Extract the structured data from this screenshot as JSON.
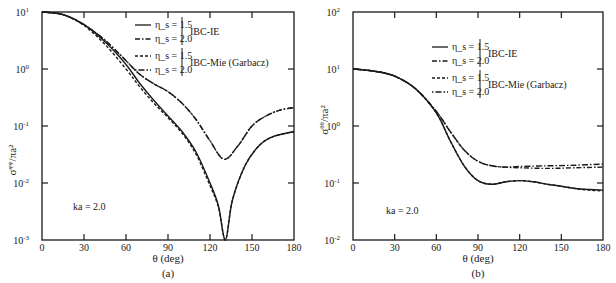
{
  "chart_data": [
    {
      "id": "a",
      "type": "line",
      "panel_label": "(a)",
      "xlabel": "θ (deg)",
      "ylabel": "σ^{φφ}/πa²",
      "ylabel_main": "σ",
      "ylabel_sup": "φφ",
      "ylabel_tail": "/πa²",
      "yscale": "log",
      "xlim": [
        0,
        180
      ],
      "ylim": [
        0.001,
        10
      ],
      "xticks": [
        0,
        30,
        60,
        90,
        120,
        150,
        180
      ],
      "yticks": [
        {
          "value": 10,
          "label_base": "10",
          "label_exp": "1"
        },
        {
          "value": 1,
          "label_base": "10",
          "label_exp": "0"
        },
        {
          "value": 0.1,
          "label_base": "10",
          "label_exp": "-1"
        },
        {
          "value": 0.01,
          "label_base": "10",
          "label_exp": "-2"
        },
        {
          "value": 0.001,
          "label_base": "10",
          "label_exp": "-3"
        }
      ],
      "annotation": "ka = 2.0",
      "grid": false,
      "legend": {
        "position": "upper-right",
        "groups": [
          {
            "label": "IBC-IE",
            "entries": [
              {
                "label": "η_s = 1.5",
                "style": "solid"
              },
              {
                "label": "η_s = 2.0",
                "style": "dash-dot"
              }
            ]
          },
          {
            "label": "IBC-Mie (Garbacz)",
            "entries": [
              {
                "label": "η_s = 1.5",
                "style": "dashed"
              },
              {
                "label": "η_s = 2.0",
                "style": "dot-dash-long"
              }
            ]
          }
        ]
      },
      "series": [
        {
          "name": "IBC-IE η_s = 1.5",
          "style": "solid",
          "x": [
            0,
            15,
            30,
            45,
            60,
            70,
            80,
            90,
            100,
            110,
            120,
            126,
            131,
            136,
            145,
            155,
            165,
            180
          ],
          "y": [
            10,
            9,
            6,
            3,
            1.2,
            0.55,
            0.28,
            0.15,
            0.08,
            0.035,
            0.01,
            0.004,
            0.001,
            0.005,
            0.02,
            0.045,
            0.065,
            0.08
          ]
        },
        {
          "name": "IBC-Mie η_s = 1.5",
          "style": "dashed",
          "x": [
            0,
            15,
            30,
            45,
            60,
            70,
            80,
            90,
            100,
            110,
            120,
            126,
            131,
            136,
            145,
            155,
            165,
            180
          ],
          "y": [
            10,
            9,
            5.8,
            2.7,
            1.0,
            0.48,
            0.25,
            0.14,
            0.075,
            0.032,
            0.009,
            0.0038,
            0.001,
            0.005,
            0.02,
            0.045,
            0.065,
            0.08
          ]
        },
        {
          "name": "IBC-IE η_s = 2.0",
          "style": "dash-dot",
          "x": [
            0,
            15,
            30,
            45,
            60,
            70,
            80,
            90,
            100,
            110,
            120,
            130,
            140,
            150,
            160,
            170,
            180
          ],
          "y": [
            10,
            9,
            6,
            3.2,
            1.4,
            0.8,
            0.55,
            0.4,
            0.25,
            0.13,
            0.055,
            0.026,
            0.045,
            0.1,
            0.15,
            0.19,
            0.21
          ]
        },
        {
          "name": "IBC-Mie η_s = 2.0",
          "style": "dot-dash-long",
          "x": [
            0,
            15,
            30,
            45,
            60,
            70,
            80,
            90,
            100,
            110,
            120,
            130,
            140,
            150,
            160,
            170,
            180
          ],
          "y": [
            10,
            9,
            6,
            3.2,
            1.4,
            0.8,
            0.55,
            0.4,
            0.25,
            0.13,
            0.055,
            0.026,
            0.045,
            0.1,
            0.15,
            0.19,
            0.21
          ]
        }
      ]
    },
    {
      "id": "b",
      "type": "line",
      "panel_label": "(b)",
      "xlabel": "θ (deg)",
      "ylabel": "σ^{θθ}/πa²",
      "ylabel_main": "σ",
      "ylabel_sup": "θθ",
      "ylabel_tail": "/πa²",
      "yscale": "log",
      "xlim": [
        0,
        180
      ],
      "ylim": [
        0.01,
        100
      ],
      "xticks": [
        0,
        30,
        60,
        90,
        120,
        150,
        180
      ],
      "yticks": [
        {
          "value": 100,
          "label_base": "10",
          "label_exp": "2"
        },
        {
          "value": 10,
          "label_base": "10",
          "label_exp": "1"
        },
        {
          "value": 1,
          "label_base": "10",
          "label_exp": "0"
        },
        {
          "value": 0.1,
          "label_base": "10",
          "label_exp": "-1"
        },
        {
          "value": 0.01,
          "label_base": "10",
          "label_exp": "-2"
        }
      ],
      "annotation": "ka = 2.0",
      "grid": false,
      "legend": {
        "position": "upper-right",
        "groups": [
          {
            "label": "IBC-IE",
            "entries": [
              {
                "label": "η_s = 1.5",
                "style": "solid"
              },
              {
                "label": "η_s = 2.0",
                "style": "dash-dot"
              }
            ]
          },
          {
            "label": "IBC-Mie (Garbacz)",
            "entries": [
              {
                "label": "η_s = 1.5",
                "style": "dashed"
              },
              {
                "label": "η_s = 2.0",
                "style": "dot-dash-long"
              }
            ]
          }
        ]
      },
      "series": [
        {
          "name": "IBC-IE η_s = 1.5",
          "style": "solid",
          "x": [
            0,
            15,
            30,
            45,
            60,
            70,
            80,
            90,
            100,
            110,
            120,
            130,
            140,
            150,
            160,
            170,
            180
          ],
          "y": [
            10,
            9.2,
            7.5,
            4.5,
            1.7,
            0.55,
            0.2,
            0.11,
            0.095,
            0.105,
            0.11,
            0.105,
            0.095,
            0.088,
            0.08,
            0.077,
            0.075
          ]
        },
        {
          "name": "IBC-Mie η_s = 1.5",
          "style": "dashed",
          "x": [
            0,
            15,
            30,
            45,
            60,
            70,
            80,
            90,
            100,
            110,
            120,
            130,
            140,
            150,
            160,
            170,
            180
          ],
          "y": [
            10,
            9.2,
            7.5,
            4.5,
            1.7,
            0.55,
            0.2,
            0.11,
            0.095,
            0.105,
            0.11,
            0.105,
            0.095,
            0.088,
            0.08,
            0.075,
            0.073
          ]
        },
        {
          "name": "IBC-IE η_s = 2.0",
          "style": "dash-dot",
          "x": [
            0,
            15,
            30,
            45,
            60,
            70,
            80,
            90,
            100,
            110,
            120,
            140,
            160,
            180
          ],
          "y": [
            10,
            9.2,
            7.5,
            4.5,
            1.8,
            0.8,
            0.38,
            0.24,
            0.2,
            0.19,
            0.185,
            0.18,
            0.185,
            0.19
          ]
        },
        {
          "name": "IBC-Mie η_s = 2.0",
          "style": "dot-dash-long",
          "x": [
            0,
            15,
            30,
            45,
            60,
            70,
            80,
            90,
            100,
            110,
            120,
            140,
            160,
            180
          ],
          "y": [
            10,
            9.2,
            7.5,
            4.5,
            1.8,
            0.8,
            0.38,
            0.24,
            0.2,
            0.19,
            0.195,
            0.2,
            0.205,
            0.215
          ]
        }
      ]
    }
  ]
}
